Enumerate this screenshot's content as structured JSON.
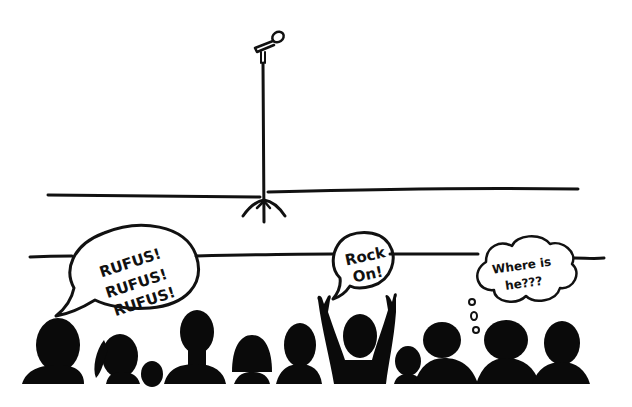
{
  "scene": {
    "description": "Hand-drawn cartoon: empty stage with a microphone stand, audience in silhouette below",
    "colors": {
      "ink": "#111111",
      "background": "#ffffff"
    }
  },
  "bubbles": {
    "left": {
      "type": "speech",
      "lines": [
        "RUFUS!",
        "RUFUS!",
        "RUFUS!"
      ]
    },
    "middle": {
      "type": "speech",
      "lines": [
        "Rock",
        "On!"
      ]
    },
    "right": {
      "type": "thought",
      "lines": [
        "Where is",
        "he???"
      ]
    }
  },
  "stage": {
    "prop": "microphone-stand"
  },
  "audience": {
    "count": 12
  }
}
